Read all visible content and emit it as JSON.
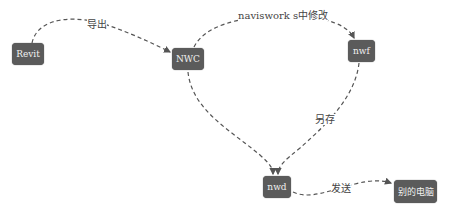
{
  "nodes": {
    "revit": {
      "label": "Revit"
    },
    "nwc": {
      "label": "NWC"
    },
    "nwf": {
      "label": "nwf"
    },
    "nwd": {
      "label": "nwd"
    },
    "other_pc": {
      "label": "别的电脑"
    }
  },
  "edges": {
    "revit_nwc": {
      "label": "导出"
    },
    "nwc_nwf": {
      "label": "naviswork s中修改"
    },
    "nwf_nwd": {
      "label": "另存"
    },
    "nwd_other": {
      "label": "发送"
    }
  },
  "colors": {
    "node_fill": "#5b5b5b",
    "edge": "#555555",
    "text": "#444444"
  }
}
